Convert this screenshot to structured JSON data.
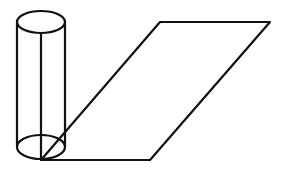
{
  "figure": {
    "stroke_color": "#111111",
    "background": "#ffffff",
    "cylinder": {
      "top_ellipse": {
        "cx": 41,
        "cy": 22,
        "rx": 24,
        "ry": 11
      },
      "bottom_ellipse": {
        "cx": 41,
        "cy": 147,
        "rx": 24,
        "ry": 12
      },
      "left_x": 17,
      "right_x": 65,
      "axis_x": 41
    },
    "parallelogram": {
      "points": [
        [
          41,
          160
        ],
        [
          150,
          160
        ],
        [
          270,
          22
        ],
        [
          160,
          22
        ]
      ]
    }
  }
}
